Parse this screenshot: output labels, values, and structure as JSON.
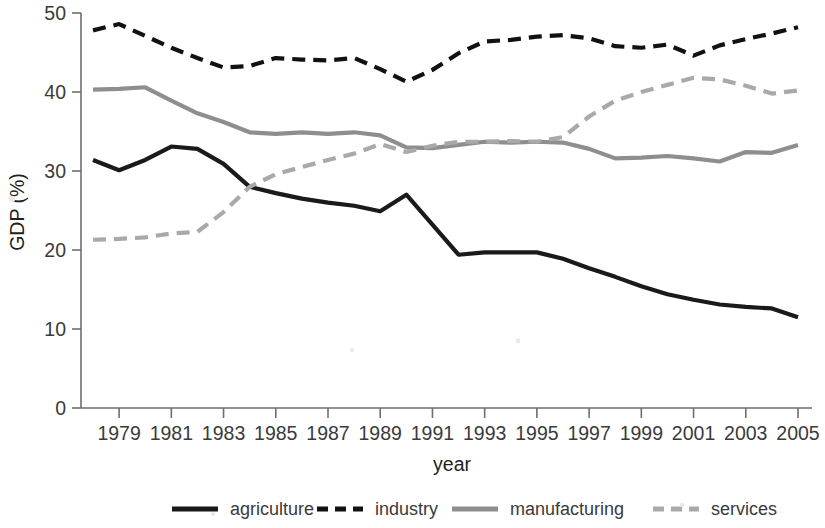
{
  "chart_data": {
    "type": "line",
    "title": "",
    "xlabel": "year",
    "ylabel": "GDP (%)",
    "xlim": [
      1978,
      2005
    ],
    "ylim": [
      0,
      50
    ],
    "grid": false,
    "legend_position": "bottom",
    "ytick_labels": [
      "0",
      "10",
      "20",
      "30",
      "40",
      "50"
    ],
    "ytick_values": [
      0,
      10,
      20,
      30,
      40,
      50
    ],
    "xtick_labels": [
      "1979",
      "1981",
      "1983",
      "1985",
      "1987",
      "1989",
      "1991",
      "1993",
      "1995",
      "1997",
      "1999",
      "2001",
      "2003",
      "2005"
    ],
    "xtick_values": [
      1979,
      1981,
      1983,
      1985,
      1987,
      1989,
      1991,
      1993,
      1995,
      1997,
      1999,
      2001,
      2003,
      2005
    ],
    "x": [
      1978,
      1979,
      1980,
      1981,
      1982,
      1983,
      1984,
      1985,
      1986,
      1987,
      1988,
      1989,
      1990,
      1991,
      1992,
      1993,
      1994,
      1995,
      1996,
      1997,
      1998,
      1999,
      2000,
      2001,
      2002,
      2003,
      2004,
      2005
    ],
    "series": [
      {
        "name": "agriculture",
        "color": "#1a1a1a",
        "style": "solid",
        "width": 4.2,
        "values": [
          31.4,
          30.1,
          31.4,
          33.1,
          32.8,
          30.9,
          28.0,
          27.2,
          26.5,
          26.0,
          25.6,
          24.9,
          27.0,
          23.2,
          19.4,
          19.7,
          19.7,
          19.7,
          18.9,
          17.7,
          16.6,
          15.4,
          14.4,
          13.7,
          13.1,
          12.8,
          12.6,
          11.5
        ]
      },
      {
        "name": "industry",
        "color": "#111111",
        "style": "dashed",
        "width": 4.2,
        "values": [
          47.8,
          48.6,
          47.1,
          45.6,
          44.3,
          43.1,
          43.3,
          44.3,
          44.1,
          44.0,
          44.3,
          42.9,
          41.3,
          42.8,
          44.9,
          46.4,
          46.6,
          47.0,
          47.2,
          46.8,
          45.8,
          45.6,
          46.0,
          44.6,
          45.9,
          46.7,
          47.4,
          48.2
        ]
      },
      {
        "name": "manufacturing",
        "color": "#8e8e90",
        "style": "solid",
        "width": 4.2,
        "values": [
          40.3,
          40.4,
          40.6,
          38.9,
          37.3,
          36.2,
          34.9,
          34.7,
          34.9,
          34.7,
          34.9,
          34.5,
          33.0,
          32.9,
          33.3,
          33.7,
          33.6,
          33.7,
          33.6,
          32.8,
          31.6,
          31.7,
          31.9,
          31.6,
          31.2,
          32.4,
          32.3,
          33.3
        ]
      },
      {
        "name": "services",
        "color": "#a7a9ab",
        "style": "dashed",
        "width": 4.2,
        "values": [
          21.3,
          21.4,
          21.6,
          22.1,
          22.3,
          24.8,
          28.0,
          29.6,
          30.5,
          31.4,
          32.2,
          33.4,
          32.4,
          33.2,
          33.7,
          33.7,
          33.8,
          33.7,
          34.3,
          36.9,
          38.9,
          40.0,
          40.9,
          41.8,
          41.6,
          40.8,
          39.8,
          40.2
        ]
      }
    ],
    "legend": [
      {
        "label": "agriculture",
        "color": "#1a1a1a",
        "style": "solid"
      },
      {
        "label": "industry",
        "color": "#111111",
        "style": "dashed"
      },
      {
        "label": "manufacturing",
        "color": "#8e8e90",
        "style": "solid"
      },
      {
        "label": "services",
        "color": "#a7a9ab",
        "style": "dashed"
      }
    ]
  }
}
